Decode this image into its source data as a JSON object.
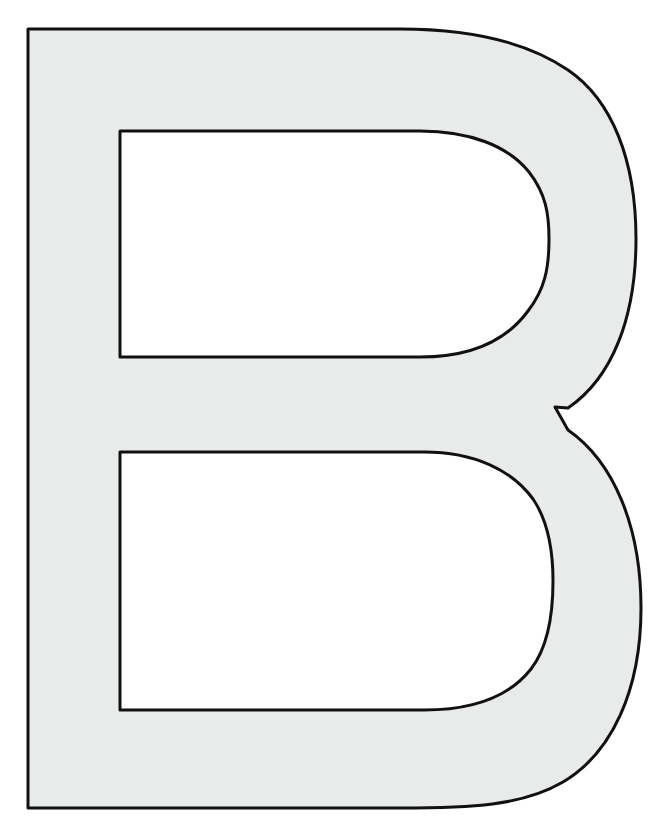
{
  "page": {
    "background_color": "#ffffff",
    "width": 664,
    "height": 836
  },
  "artwork": {
    "name": "uppercase-letter-b-outline",
    "character": "B",
    "description": "Large uppercase letter B outline template, light gray fill with thin black outline, two rounded counters",
    "fill_color": "#e9eaea",
    "stroke_color": "#111111",
    "stroke_width": 3,
    "counter_fill_color": "#ffffff",
    "stem": {
      "left_x": 28,
      "top_y": 29,
      "bottom_y": 808,
      "width": 92
    },
    "upper_bowl": {
      "max_x": 636,
      "center_y": 239,
      "counter_left_x": 120,
      "counter_top_y": 131,
      "counter_bottom_y": 357,
      "counter_max_x": 549
    },
    "lower_bowl": {
      "max_x": 641,
      "center_y": 608,
      "counter_left_x": 120,
      "counter_top_y": 452,
      "counter_bottom_y": 710,
      "counter_max_x": 553
    },
    "waist": {
      "notch_x": 555,
      "notch_y": 407
    },
    "outer_path": "M 28 29 L 400 29 C 470 29 527 42 568 70 C 612 100 636 160 636 239 C 636 318 612 378 568 408 L 555 407 L 568 430 C 614 462 641 527 641 608 C 641 690 612 753 563 782 C 522 806 470 808 400 808 L 28 808 Z",
    "upper_counter_path": "M 120 131 L 420 131 C 470 131 508 146 529 172 C 546 194 549 214 549 239 C 549 268 545 289 528 311 C 506 341 470 357 420 357 L 120 357 Z",
    "lower_counter_path": "M 120 452 L 424 452 C 474 452 512 470 533 499 C 548 521 553 551 553 581 C 553 613 548 647 531 669 C 509 697 474 710 424 710 L 120 710 Z"
  }
}
